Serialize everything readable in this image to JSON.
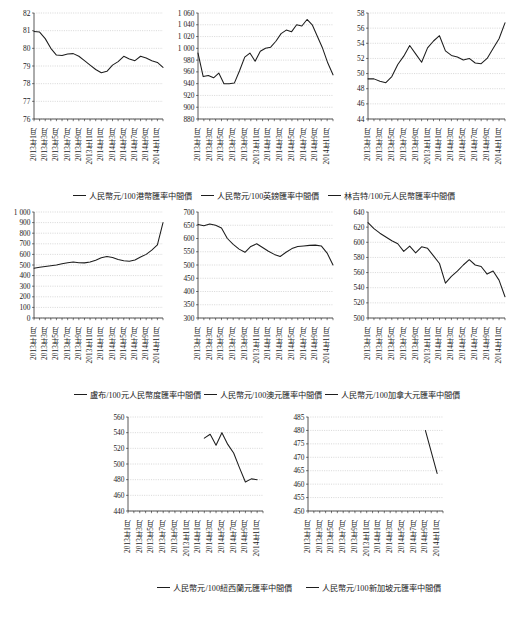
{
  "figure": {
    "x_tick_labels": [
      "2013年1月",
      "2013年3月",
      "2013年5月",
      "2013年7月",
      "2013年9月",
      "2013年11月",
      "2014年1月",
      "2014年3月",
      "2014年5月",
      "2014年7月",
      "2014年9月",
      "2014年11月"
    ],
    "line_color": "#1d1d1d",
    "grid_color": "#b9b9b9",
    "background": "#ffffff"
  },
  "chart_data": [
    {
      "type": "line",
      "title": "",
      "legend": "人民幣元/100港幣匯率中間價",
      "legend_position": "below",
      "xlabel": "",
      "ylabel": "",
      "ylim": [
        76,
        82
      ],
      "yticks": [
        76,
        77,
        78,
        79,
        80,
        81,
        82
      ],
      "ytick_labels": [
        "76",
        "77",
        "78",
        "79",
        "80",
        "81",
        "82"
      ],
      "grid": true,
      "x": [
        "2013-01",
        "2013-02",
        "2013-03",
        "2013-04",
        "2013-05",
        "2013-06",
        "2013-07",
        "2013-08",
        "2013-09",
        "2013-10",
        "2013-11",
        "2013-12",
        "2014-01",
        "2014-02",
        "2014-03",
        "2014-04",
        "2014-05",
        "2014-06",
        "2014-07",
        "2014-08",
        "2014-09",
        "2014-10",
        "2014-11",
        "2014-12"
      ],
      "values": [
        80.95,
        80.92,
        80.55,
        80.0,
        79.62,
        79.6,
        79.68,
        79.7,
        79.55,
        79.3,
        79.05,
        78.8,
        78.62,
        78.7,
        79.05,
        79.25,
        79.55,
        79.4,
        79.3,
        79.55,
        79.45,
        79.3,
        79.2,
        78.92
      ]
    },
    {
      "type": "line",
      "title": "",
      "legend": "人民幣元/100英鎊匯率中間價",
      "legend_position": "below",
      "xlabel": "",
      "ylabel": "",
      "ylim": [
        880,
        1060
      ],
      "yticks": [
        880,
        900,
        920,
        940,
        960,
        980,
        1000,
        1020,
        1040,
        1060
      ],
      "ytick_labels": [
        "880",
        "900",
        "920",
        "940",
        "960",
        "980",
        "1 000",
        "1 020",
        "1 040",
        "1 060"
      ],
      "grid": true,
      "x": [
        "2013-01",
        "2013-02",
        "2013-03",
        "2013-04",
        "2013-05",
        "2013-06",
        "2013-07",
        "2013-08",
        "2013-09",
        "2013-10",
        "2013-11",
        "2013-12",
        "2014-01",
        "2014-02",
        "2014-03",
        "2014-04",
        "2014-05",
        "2014-06",
        "2014-07",
        "2014-08",
        "2014-09",
        "2014-10",
        "2014-11",
        "2014-12"
      ],
      "values": [
        992,
        952,
        954,
        950,
        958,
        940,
        940,
        941,
        962,
        985,
        992,
        978,
        995,
        1000,
        1002,
        1012,
        1025,
        1031,
        1028,
        1040,
        1038,
        1049,
        1040,
        1020,
        1000,
        975,
        955
      ]
    },
    {
      "type": "line",
      "title": "",
      "legend": "林吉特/100元人民幣匯率中間價",
      "legend_position": "below",
      "xlabel": "",
      "ylabel": "",
      "ylim": [
        44,
        58
      ],
      "yticks": [
        44,
        46,
        48,
        50,
        52,
        54,
        56,
        58
      ],
      "ytick_labels": [
        "44",
        "46",
        "48",
        "50",
        "52",
        "54",
        "56",
        "58"
      ],
      "grid": true,
      "x": [
        "2013-01",
        "2013-02",
        "2013-03",
        "2013-04",
        "2013-05",
        "2013-06",
        "2013-07",
        "2013-08",
        "2013-09",
        "2013-10",
        "2013-11",
        "2013-12",
        "2014-01",
        "2014-02",
        "2014-03",
        "2014-04",
        "2014-05",
        "2014-06",
        "2014-07",
        "2014-08",
        "2014-09",
        "2014-10",
        "2014-11",
        "2014-12"
      ],
      "values": [
        49.3,
        49.3,
        49.0,
        48.8,
        49.6,
        51.2,
        52.3,
        53.7,
        52.6,
        51.5,
        53.4,
        54.3,
        55.0,
        53.0,
        52.4,
        52.2,
        51.8,
        52.0,
        51.4,
        51.3,
        52.0,
        53.3,
        54.6,
        56.7
      ]
    },
    {
      "type": "line",
      "title": "",
      "legend": "盧布/100元人民幣度匯率中間價",
      "legend_position": "below",
      "xlabel": "",
      "ylabel": "",
      "ylim": [
        0,
        1000
      ],
      "yticks": [
        0,
        100,
        200,
        300,
        400,
        500,
        600,
        700,
        800,
        900,
        1000
      ],
      "ytick_labels": [
        "0",
        "100",
        "200",
        "300",
        "400",
        "500",
        "600",
        "700",
        "800",
        "900",
        "1 000"
      ],
      "grid": true,
      "x": [
        "2013-01",
        "2013-02",
        "2013-03",
        "2013-04",
        "2013-05",
        "2013-06",
        "2013-07",
        "2013-08",
        "2013-09",
        "2013-10",
        "2013-11",
        "2013-12",
        "2014-01",
        "2014-02",
        "2014-03",
        "2014-04",
        "2014-05",
        "2014-06",
        "2014-07",
        "2014-08",
        "2014-09",
        "2014-10",
        "2014-11",
        "2014-12"
      ],
      "values": [
        470,
        478,
        485,
        492,
        500,
        512,
        522,
        528,
        522,
        520,
        528,
        545,
        568,
        580,
        570,
        552,
        540,
        535,
        548,
        575,
        600,
        640,
        690,
        900
      ]
    },
    {
      "type": "line",
      "title": "",
      "legend": "人民幣元/100澳元匯率中間價",
      "legend_position": "below",
      "xlabel": "",
      "ylabel": "",
      "ylim": [
        300,
        700
      ],
      "yticks": [
        300,
        350,
        400,
        450,
        500,
        550,
        600,
        650,
        700
      ],
      "ytick_labels": [
        "300",
        "350",
        "400",
        "450",
        "500",
        "550",
        "600",
        "650",
        "700"
      ],
      "grid": true,
      "x": [
        "2013-01",
        "2013-02",
        "2013-03",
        "2013-04",
        "2013-05",
        "2013-06",
        "2013-07",
        "2013-08",
        "2013-09",
        "2013-10",
        "2013-11",
        "2013-12",
        "2014-01",
        "2014-02",
        "2014-03",
        "2014-04",
        "2014-05",
        "2014-06",
        "2014-07",
        "2014-08",
        "2014-09",
        "2014-10",
        "2014-11",
        "2014-12"
      ],
      "values": [
        653,
        648,
        655,
        650,
        640,
        600,
        578,
        560,
        548,
        570,
        580,
        566,
        552,
        540,
        532,
        548,
        562,
        570,
        572,
        574,
        575,
        572,
        545,
        500
      ]
    },
    {
      "type": "line",
      "title": "",
      "legend": "人民幣元/100加拿大元匯率中間價",
      "legend_position": "below",
      "xlabel": "",
      "ylabel": "",
      "ylim": [
        500,
        640
      ],
      "yticks": [
        500,
        520,
        540,
        560,
        580,
        600,
        620,
        640
      ],
      "ytick_labels": [
        "500",
        "520",
        "540",
        "560",
        "580",
        "600",
        "620",
        "640"
      ],
      "grid": true,
      "x": [
        "2013-01",
        "2013-02",
        "2013-03",
        "2013-04",
        "2013-05",
        "2013-06",
        "2013-07",
        "2013-08",
        "2013-09",
        "2013-10",
        "2013-11",
        "2013-12",
        "2014-01",
        "2014-02",
        "2014-03",
        "2014-04",
        "2014-05",
        "2014-06",
        "2014-07",
        "2014-08",
        "2014-09",
        "2014-10",
        "2014-11",
        "2014-12"
      ],
      "values": [
        626,
        618,
        612,
        607,
        602,
        598,
        588,
        595,
        586,
        594,
        592,
        582,
        572,
        546,
        555,
        562,
        570,
        577,
        570,
        568,
        558,
        562,
        550,
        528
      ]
    },
    {
      "type": "line",
      "title": "",
      "legend": "人民幣元/100紐西蘭元匯率中間價",
      "legend_position": "below",
      "xlabel": "",
      "ylabel": "",
      "ylim": [
        440,
        560
      ],
      "yticks": [
        440,
        460,
        480,
        500,
        520,
        540,
        560
      ],
      "ytick_labels": [
        "440",
        "460",
        "480",
        "500",
        "520",
        "540",
        "560"
      ],
      "grid": true,
      "x": [
        "2014-02",
        "2014-03",
        "2014-04",
        "2014-05",
        "2014-06",
        "2014-07",
        "2014-08",
        "2014-09",
        "2014-10",
        "2014-11"
      ],
      "values": [
        533,
        538,
        524,
        540,
        525,
        514,
        495,
        477,
        481,
        480
      ]
    },
    {
      "type": "line",
      "title": "",
      "legend": "人民幣元/100新加坡元匯率中間價",
      "legend_position": "below",
      "xlabel": "",
      "ylabel": "",
      "ylim": [
        450,
        485
      ],
      "yticks": [
        450,
        455,
        460,
        465,
        470,
        475,
        480,
        485
      ],
      "ytick_labels": [
        "450",
        "455",
        "460",
        "465",
        "470",
        "475",
        "480",
        "485"
      ],
      "grid": true,
      "x": [
        "2014-09",
        "2014-11"
      ],
      "values": [
        480,
        464
      ]
    }
  ]
}
